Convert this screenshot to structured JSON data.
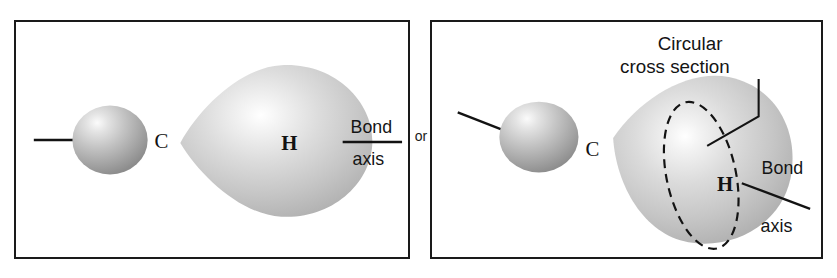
{
  "figure": {
    "connector_label": "or",
    "background_color": "#ffffff",
    "border_color": "#1a1a1a",
    "orbital_fill_light": "#fdfdfd",
    "orbital_fill_mid": "#c9c9c9",
    "orbital_fill_dark": "#9a9a9a",
    "sphere_fill_light": "#f2f2f2",
    "sphere_fill_mid": "#b8b8b8",
    "sphere_fill_dark": "#8a8a8a"
  },
  "panels": [
    {
      "id": "left",
      "name": "side-view-panel",
      "carbon_label": "C",
      "hydrogen_label": "H",
      "bond_axis_line_1": "Bond",
      "bond_axis_line_2": "axis",
      "has_cross_section": false
    },
    {
      "id": "right",
      "name": "perspective-view-panel",
      "carbon_label": "C",
      "hydrogen_label": "H",
      "bond_axis_line_1": "Bond",
      "bond_axis_line_2": "axis",
      "has_cross_section": true,
      "cross_section_line_1": "Circular",
      "cross_section_line_2": "cross section"
    }
  ]
}
